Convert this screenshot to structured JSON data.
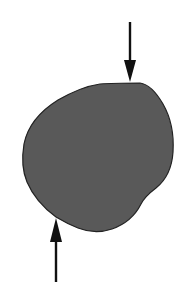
{
  "diagram": {
    "colors": {
      "background": "#ffffff",
      "shape_fill": "#595959",
      "shape_stroke": "#222222",
      "arrow": "#111111"
    },
    "arrows": [
      {
        "name": "top-force-arrow",
        "direction": "down",
        "x": 130,
        "y_start": 22,
        "y_tip": 82
      },
      {
        "name": "bottom-force-arrow",
        "direction": "up",
        "x": 56,
        "y_start": 282,
        "y_tip": 218
      }
    ]
  }
}
